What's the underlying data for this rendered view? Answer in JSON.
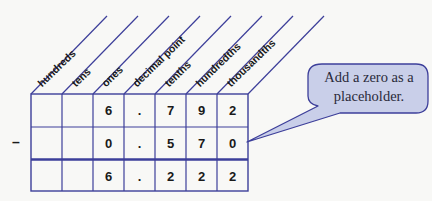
{
  "diagram": {
    "type": "place-value subtraction chart",
    "colors": {
      "grid_line": "#3d3f9a",
      "callout_fill": "#c9cfe9",
      "callout_border": "#3d3f9a",
      "text": "#1a1a1a",
      "background": "#f8f8f6"
    },
    "columns": [
      {
        "label": "hundreds"
      },
      {
        "label": "tens"
      },
      {
        "label": "ones"
      },
      {
        "label": "decimal point"
      },
      {
        "label": "tenths"
      },
      {
        "label": "hundredths"
      },
      {
        "label": "thousandths"
      }
    ],
    "operator": "–",
    "rows": [
      {
        "role": "minuend",
        "cells": [
          "",
          "",
          "6",
          ".",
          "7",
          "9",
          "2"
        ]
      },
      {
        "role": "subtrahend",
        "cells": [
          "",
          "",
          "0",
          ".",
          "5",
          "7",
          "0"
        ]
      },
      {
        "role": "difference",
        "cells": [
          "",
          "",
          "6",
          ".",
          "2",
          "2",
          "2"
        ]
      }
    ],
    "callout": {
      "lines": [
        "Add a zero as a",
        "placeholder."
      ],
      "points_to": "subtrahend thousandths cell (0)"
    }
  }
}
